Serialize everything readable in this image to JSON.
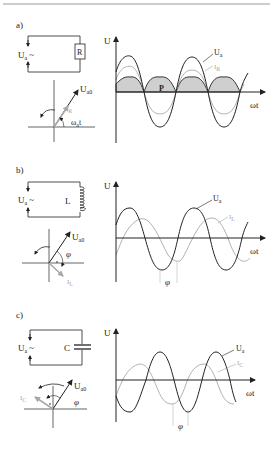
{
  "panels": [
    {
      "id": "a",
      "label": "a)",
      "source_label": "U",
      "source_sub": "a",
      "source_symbol": "~",
      "component_label": "R",
      "phasor_u_label": "U",
      "phasor_u_sub": "a0",
      "phasor_i_label": "I",
      "phasor_i_sub": "R",
      "phasor_angle_label": "ω",
      "phasor_angle_sub": "a",
      "phasor_angle_suffix": "t",
      "graph_y_label": "U",
      "graph_x_label": "ωt",
      "curve_u_label": "U",
      "curve_u_sub": "a",
      "curve_i_label": "I",
      "curve_i_sub": "R",
      "power_label": "P"
    },
    {
      "id": "b",
      "label": "b)",
      "source_label": "U",
      "source_sub": "a",
      "source_symbol": "~",
      "component_label": "L",
      "phasor_u_label": "U",
      "phasor_u_sub": "a0",
      "phasor_i_label": "I",
      "phasor_i_sub": "L",
      "phasor_angle_label": "φ",
      "graph_y_label": "U",
      "graph_x_label": "ωt",
      "curve_u_label": "U",
      "curve_u_sub": "a",
      "curve_i_label": "I",
      "curve_i_sub": "L",
      "phase_label": "φ"
    },
    {
      "id": "c",
      "label": "c)",
      "source_label": "U",
      "source_sub": "a",
      "source_symbol": "~",
      "component_label": "C",
      "phasor_u_label": "U",
      "phasor_u_sub": "a0",
      "phasor_i_label": "I",
      "phasor_i_sub": "C",
      "phasor_angle_label": "φ",
      "graph_y_label": "U",
      "graph_x_label": "ωt",
      "curve_u_label": "U",
      "curve_u_sub": "a",
      "curve_i_label": "I",
      "curve_i_sub": "C",
      "phase_label": "φ"
    }
  ],
  "colors": {
    "ink": "#222222",
    "current": "#a8a8a8",
    "power_fill": "#cfcfcf",
    "top_rule": "#9a9a9a"
  }
}
